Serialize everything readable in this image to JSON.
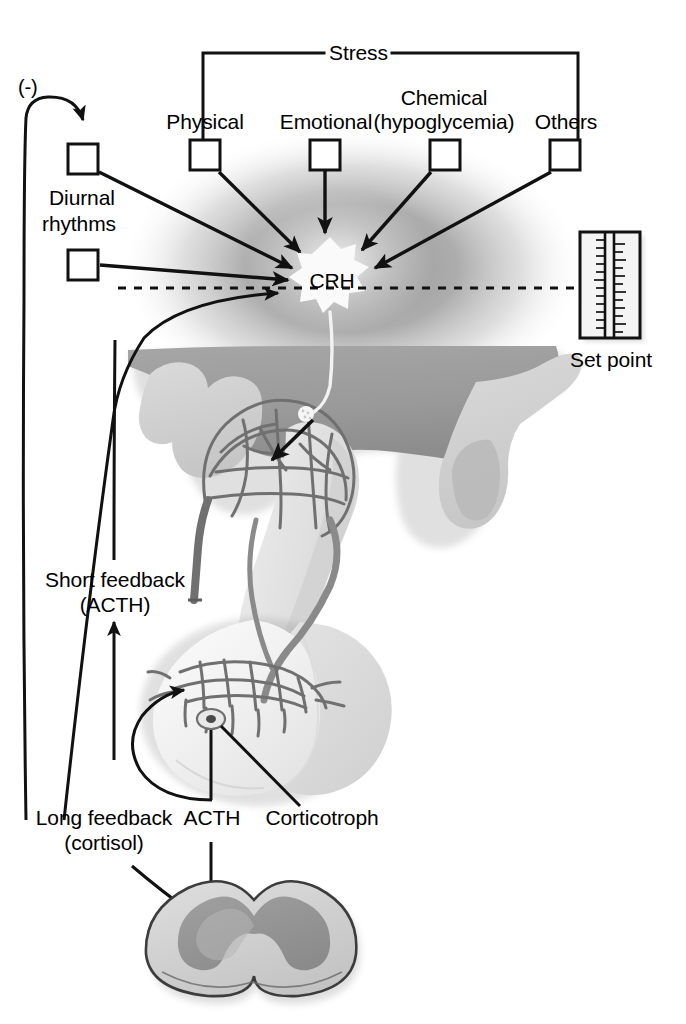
{
  "diagram": {
    "type": "biomedical-schematic",
    "background_color": "#ffffff",
    "line_color": "#111111",
    "glow_color": "#a8a8a8"
  },
  "labels": {
    "stress": "Stress",
    "negative_sign": "(-)",
    "physical": "Physical",
    "emotional": "Emotional",
    "chemical": "Chemical",
    "chemical_sub": "(hypoglycemia)",
    "others": "Others",
    "diurnal_line1": "Diurnal",
    "diurnal_line2": "rhythms",
    "crh": "CRH",
    "set_point": "Set point",
    "short_feedback_line1": "Short feedback",
    "short_feedback_line2": "(ACTH)",
    "long_feedback_line1": "Long feedback",
    "long_feedback_line2": "(cortisol)",
    "acth": "ACTH",
    "corticotroph": "Corticotroph"
  },
  "stress_inputs": [
    {
      "label": "Physical",
      "box_x": 190,
      "box_y": 140
    },
    {
      "label": "Emotional",
      "box_x": 310,
      "box_y": 140
    },
    {
      "label": "Chemical",
      "box_x": 430,
      "box_y": 140
    },
    {
      "label": "Others",
      "box_x": 550,
      "box_y": 140
    }
  ],
  "diurnal_inputs": [
    {
      "box_x": 68,
      "box_y": 144
    },
    {
      "box_x": 68,
      "box_y": 250
    }
  ],
  "structures": [
    {
      "name": "hypothalamus",
      "shade": "#9c9c9c"
    },
    {
      "name": "crh-neuron",
      "shade": "#fbfbfb"
    },
    {
      "name": "primary-capillary-plexus",
      "shade": "#8e8e8e"
    },
    {
      "name": "hypophyseal-portal-vessel",
      "shade": "#8e8e8e"
    },
    {
      "name": "secondary-capillary-plexus",
      "shade": "#8e8e8e"
    },
    {
      "name": "anterior-pituitary",
      "shade": "#ededed"
    },
    {
      "name": "posterior-pituitary",
      "shade": "#dcdcdc"
    },
    {
      "name": "corticotroph-cell",
      "shade": "#9a9a9a"
    },
    {
      "name": "adrenal-gland",
      "shade": "#cfcfcf"
    },
    {
      "name": "adrenal-cortex",
      "shade": "#8e8e8e"
    }
  ],
  "set_point_gauge": {
    "tick_count": 26,
    "frame_color": "#111111",
    "face_color": "#f4f4f4"
  }
}
